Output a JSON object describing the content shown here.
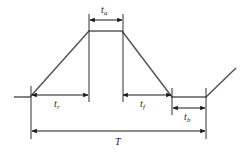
{
  "figure": {
    "background_color": "#ffffff",
    "waveform_color": "#595959",
    "annotation_color": "#1a1a1a"
  },
  "labels": {
    "ta": {
      "base": "t",
      "sub": "a",
      "meaning": "pulse top / plateau duration"
    },
    "tr": {
      "base": "t",
      "sub": "r",
      "meaning": "rise time"
    },
    "tf": {
      "base": "t",
      "sub": "f",
      "meaning": "fall time"
    },
    "tb": {
      "base": "t",
      "sub": "b",
      "meaning": "base / low-level duration"
    },
    "T": {
      "base": "T",
      "sub": "",
      "meaning": "total period"
    }
  },
  "chart_data": {
    "type": "line",
    "xlabel": "",
    "ylabel": "",
    "grid": false,
    "legend": null,
    "series": [
      {
        "name": "pulse-waveform",
        "points": [
          {
            "x": 14,
            "y": 97
          },
          {
            "x": 30,
            "y": 97
          },
          {
            "x": 89,
            "y": 31
          },
          {
            "x": 122,
            "y": 31
          },
          {
            "x": 172,
            "y": 97
          },
          {
            "x": 206,
            "y": 97
          },
          {
            "x": 236,
            "y": 68
          }
        ]
      }
    ],
    "dimensions": [
      {
        "name": "ta",
        "label": "t_a",
        "x_start": 89,
        "x_end": 123,
        "y": 20,
        "span_px": 34
      },
      {
        "name": "tr",
        "label": "t_r",
        "x_start": 31,
        "x_end": 89,
        "y": 95,
        "span_px": 58
      },
      {
        "name": "tf",
        "label": "t_f",
        "x_start": 122,
        "x_end": 172,
        "y": 95,
        "span_px": 50
      },
      {
        "name": "tb",
        "label": "t_b",
        "x_start": 172,
        "x_end": 206,
        "y": 108,
        "span_px": 34
      },
      {
        "name": "T",
        "label": "T",
        "x_start": 31,
        "x_end": 206,
        "y": 131,
        "span_px": 175
      }
    ]
  }
}
